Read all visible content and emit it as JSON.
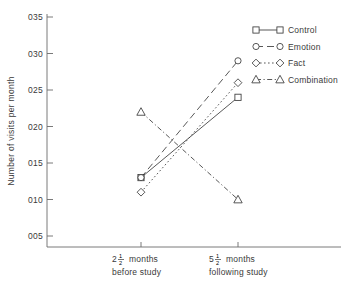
{
  "chart_data": {
    "type": "line",
    "title": "",
    "xlabel": "",
    "ylabel": "Number of visits per month",
    "categories": [
      "2½ months before study",
      "5½ months following study"
    ],
    "x": [
      0,
      1
    ],
    "ylim": [
      0.05,
      0.35
    ],
    "yticks": [
      0.05,
      0.1,
      0.15,
      0.2,
      0.25,
      0.3,
      0.35
    ],
    "ytick_labels": [
      "005",
      "010",
      "015",
      "020",
      "025",
      "030",
      "035"
    ],
    "grid": false,
    "legend_position": "top-right",
    "series": [
      {
        "name": "Control",
        "values": [
          0.13,
          0.24
        ],
        "marker": "square",
        "line": "solid"
      },
      {
        "name": "Emotion",
        "values": [
          0.13,
          0.29
        ],
        "marker": "circle",
        "line": "dashed"
      },
      {
        "name": "Fact",
        "values": [
          0.11,
          0.26
        ],
        "marker": "diamond",
        "line": "dotted"
      },
      {
        "name": "Combination",
        "values": [
          0.22,
          0.1
        ],
        "marker": "triangle",
        "line": "dash-dot"
      }
    ]
  },
  "axis": {
    "y_title": "Number of visits per month",
    "y_ticks": [
      {
        "label": "035",
        "value": 0.35
      },
      {
        "label": "030",
        "value": 0.3
      },
      {
        "label": "025",
        "value": 0.25
      },
      {
        "label": "020",
        "value": 0.2
      },
      {
        "label": "015",
        "value": 0.15
      },
      {
        "label": "010",
        "value": 0.1
      },
      {
        "label": "005",
        "value": 0.05
      }
    ],
    "x_categories": [
      {
        "whole": "2",
        "num": "1",
        "den": "2",
        "unit": "months",
        "sub": "before study"
      },
      {
        "whole": "5",
        "num": "1",
        "den": "2",
        "unit": "months",
        "sub": "following study"
      }
    ]
  },
  "legend": {
    "items": [
      {
        "label": "Control",
        "marker": "square",
        "line": "solid"
      },
      {
        "label": "Emotion",
        "marker": "circle",
        "line": "dashed"
      },
      {
        "label": "Fact",
        "marker": "diamond",
        "line": "dotted"
      },
      {
        "label": "Combination",
        "marker": "triangle",
        "line": "dash-dot"
      }
    ]
  },
  "colors": {
    "ink": "#3a3a3a",
    "axis": "#6b6b6b",
    "background": "#ffffff"
  }
}
